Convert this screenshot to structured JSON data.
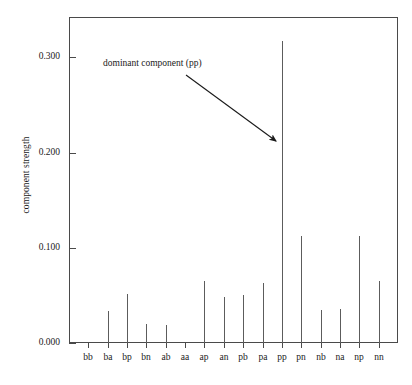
{
  "chart_data": {
    "type": "bar",
    "title": "",
    "xlabel": "",
    "ylabel": "component strength",
    "categories": [
      "bb",
      "ba",
      "bp",
      "bn",
      "ab",
      "aa",
      "ap",
      "an",
      "pb",
      "pa",
      "pp",
      "pn",
      "nb",
      "na",
      "np",
      "nn"
    ],
    "values": [
      0.0,
      0.034,
      0.051,
      0.02,
      0.019,
      0.0,
      0.065,
      0.048,
      0.05,
      0.063,
      0.317,
      0.112,
      0.035,
      0.036,
      0.112,
      0.065
    ],
    "ylim": [
      0.0,
      0.3425
    ],
    "yticks": [
      0.0,
      0.1,
      0.2,
      0.3
    ],
    "ytick_labels": [
      "0.000",
      "0.100",
      "0.200",
      "0.300"
    ],
    "grid": false,
    "legend": null,
    "annotations": [
      {
        "text": "dominant component (pp)",
        "target_category": "pp",
        "arrow": true
      }
    ],
    "series_color": "#5c5c5c",
    "axis_color": "#4a4a4a"
  }
}
